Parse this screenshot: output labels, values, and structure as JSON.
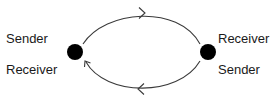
{
  "diagram": {
    "type": "two-node bidirectional communication",
    "colors": {
      "node": "#000000",
      "edge": "#3a3a3a",
      "text": "#1a1a1a",
      "background": "#ffffff"
    },
    "nodes": [
      {
        "id": "left",
        "top_label": "Sender",
        "bottom_label": "Receiver"
      },
      {
        "id": "right",
        "top_label": "Receiver",
        "bottom_label": "Sender"
      }
    ],
    "edges": [
      {
        "from": "left",
        "to": "right",
        "path": "top-arc",
        "direction": "left-to-right"
      },
      {
        "from": "right",
        "to": "left",
        "path": "bottom-arc",
        "direction": "right-to-left"
      }
    ]
  }
}
